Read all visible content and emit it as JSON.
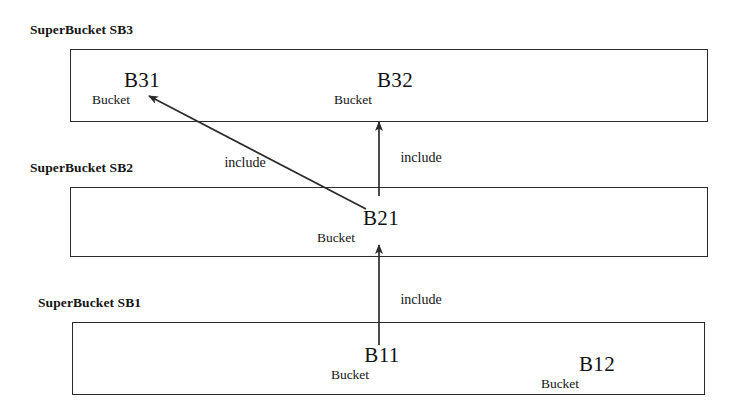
{
  "diagram": {
    "stroke_color": "#2b2b2b",
    "text_color": "#141414",
    "background": "#ffffff",
    "groups": [
      {
        "id": "sb3",
        "label": "SuperBucket SB3",
        "label_x": 30,
        "label_y": 22,
        "box": {
          "x": 70,
          "y": 49,
          "w": 638,
          "h": 73
        }
      },
      {
        "id": "sb2",
        "label": "SuperBucket SB2",
        "label_x": 30,
        "label_y": 160,
        "box": {
          "x": 70,
          "y": 187,
          "w": 638,
          "h": 70
        }
      },
      {
        "id": "sb1",
        "label": "SuperBucket SB1",
        "label_x": 38,
        "label_y": 295,
        "box": {
          "x": 72,
          "y": 322,
          "w": 633,
          "h": 73
        }
      }
    ],
    "buckets": [
      {
        "id": "b31",
        "name": "B31",
        "sub": "Bucket",
        "name_x": 142,
        "name_y": 68,
        "sub_x": 111,
        "sub_y": 92
      },
      {
        "id": "b32",
        "name": "B32",
        "sub": "Bucket",
        "name_x": 395,
        "name_y": 68,
        "sub_x": 353,
        "sub_y": 92
      },
      {
        "id": "b21",
        "name": "B21",
        "sub": "Bucket",
        "name_x": 381,
        "name_y": 206,
        "sub_x": 336,
        "sub_y": 230
      },
      {
        "id": "b11",
        "name": "B11",
        "sub": "Bucket",
        "name_x": 382,
        "name_y": 343,
        "sub_x": 350,
        "sub_y": 367
      },
      {
        "id": "b12",
        "name": "B12",
        "sub": "Bucket",
        "name_x": 597,
        "name_y": 352,
        "sub_x": 560,
        "sub_y": 376
      }
    ],
    "edges": [
      {
        "id": "b21-to-b31",
        "type": "diagonal",
        "label": "include",
        "label_x": 245,
        "label_y": 155,
        "from": {
          "x": 366,
          "y": 209
        },
        "to": {
          "x": 149,
          "y": 96
        }
      },
      {
        "id": "b21-to-b32",
        "type": "vertical",
        "label": "include",
        "label_x": 421,
        "label_y": 150,
        "from": {
          "x": 379,
          "y": 196
        },
        "to": {
          "x": 379,
          "y": 122
        }
      },
      {
        "id": "b11-to-b21",
        "type": "vertical",
        "label": "include",
        "label_x": 421,
        "label_y": 292,
        "from": {
          "x": 379,
          "y": 345
        },
        "to": {
          "x": 379,
          "y": 245
        }
      }
    ]
  }
}
